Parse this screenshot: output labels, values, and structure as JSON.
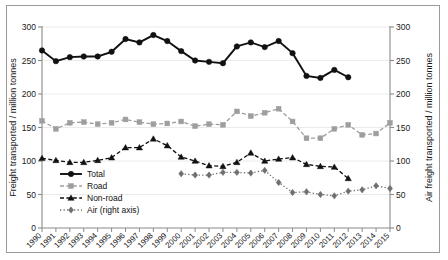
{
  "figure": {
    "background": "#ffffff",
    "frame_color": "#9a9a9a"
  },
  "chart_data": {
    "type": "line",
    "title": "",
    "xlabel": "",
    "ylabel": "Freight transported / million tonnes",
    "y2label": "Air freight transported / million tonnes",
    "ylim": [
      0,
      300
    ],
    "y2lim": [
      0,
      300
    ],
    "yticks": [
      0,
      50,
      100,
      150,
      200,
      250,
      300
    ],
    "y2ticks": [
      0,
      50,
      100,
      150,
      200,
      250,
      300
    ],
    "grid": true,
    "legend_position": "lower-left-inside",
    "categories": [
      "1990",
      "1991",
      "1992",
      "1993",
      "1994",
      "1995",
      "1996",
      "1997",
      "1998",
      "1999",
      "2000",
      "2001",
      "2002",
      "2003",
      "2004",
      "2005",
      "2006",
      "2007",
      "2008",
      "2009",
      "2010",
      "2011",
      "2012",
      "2013",
      "2014",
      "2015"
    ],
    "series": [
      {
        "name": "Total",
        "axis": "left",
        "color": "#111111",
        "marker": "circle",
        "linestyle": "solid",
        "values": [
          265,
          249,
          255,
          256,
          256,
          263,
          282,
          277,
          288,
          279,
          264,
          250,
          248,
          246,
          271,
          277,
          270,
          279,
          261,
          227,
          224,
          236,
          225,
          null,
          null,
          null
        ]
      },
      {
        "name": "Road",
        "axis": "left",
        "color": "#9e9e9e",
        "marker": "square",
        "linestyle": "dashed",
        "values": [
          160,
          148,
          157,
          158,
          155,
          157,
          162,
          158,
          155,
          156,
          159,
          152,
          155,
          154,
          174,
          167,
          172,
          178,
          159,
          134,
          134,
          148,
          154,
          139,
          141,
          157
        ]
      },
      {
        "name": "Non-road",
        "axis": "left",
        "color": "#111111",
        "marker": "triangle",
        "linestyle": "dashed",
        "values": [
          104,
          101,
          98,
          98,
          101,
          105,
          120,
          120,
          133,
          123,
          106,
          100,
          93,
          92,
          98,
          112,
          100,
          103,
          105,
          95,
          92,
          91,
          74,
          null,
          null,
          null
        ]
      },
      {
        "name": "Air (right axis)",
        "axis": "right",
        "color": "#6f6f6f",
        "marker": "diamond",
        "linestyle": "dotted",
        "values": [
          null,
          null,
          null,
          null,
          null,
          null,
          null,
          null,
          null,
          null,
          81,
          79,
          79,
          83,
          83,
          82,
          86,
          68,
          53,
          54,
          50,
          48,
          55,
          57,
          63,
          59
        ]
      }
    ]
  },
  "legend": {
    "items": [
      {
        "label": "Total"
      },
      {
        "label": "Road"
      },
      {
        "label": "Non-road"
      },
      {
        "label": "Air (right axis)"
      }
    ]
  }
}
